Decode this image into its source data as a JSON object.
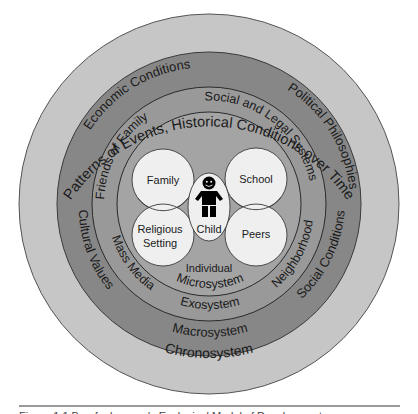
{
  "diagram": {
    "colors": {
      "chronosystem": "#c6c6c6",
      "macrosystem": "#878787",
      "exosystem": "#999999",
      "microsystem": "#a4a4a4",
      "inner_circle": "#efefef",
      "stroke": "#3a3a3a",
      "text": "#1a1a1a",
      "child_figure": "#000000"
    },
    "rings": {
      "chronosystem": {
        "name": "Chronosystem",
        "top_label": "Patterns of Events, Historical Conditions over Time"
      },
      "macrosystem": {
        "name": "Macrosystem",
        "labels": [
          "Economic Conditions",
          "Political Philosophies",
          "Cultural Values",
          "Social Conditions"
        ]
      },
      "exosystem": {
        "name": "Exosystem",
        "labels": [
          "Friends of Family",
          "Social and Legal Systems",
          "Mass Media",
          "Neighborhood"
        ]
      },
      "microsystem": {
        "name": "Microsystem",
        "center_label": "Individual"
      }
    },
    "micro_settings": [
      {
        "label": "Family"
      },
      {
        "label": "School"
      },
      {
        "label_line1": "Religious",
        "label_line2": "Setting"
      },
      {
        "label": "Peers"
      }
    ],
    "individual": {
      "label": "Child",
      "icon": "child-figure-icon"
    }
  },
  "caption": {
    "text": "Figure 1.1  Bronfenbrenner's Ecological Model of Development"
  }
}
